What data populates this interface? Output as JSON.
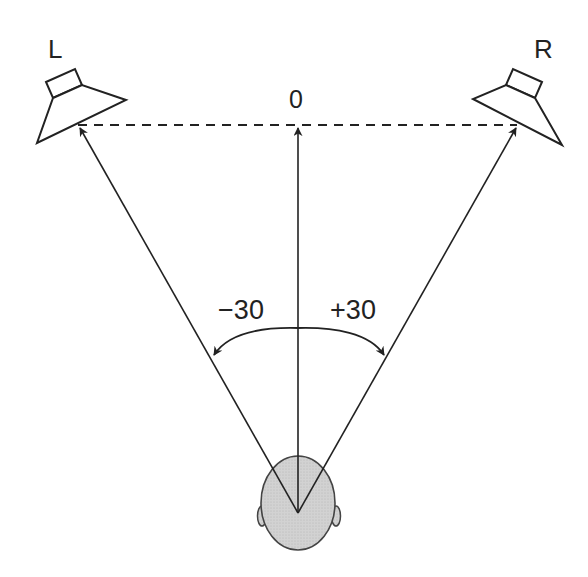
{
  "diagram": {
    "type": "stereo-listening-triangle",
    "speakers": {
      "left": {
        "label": "L"
      },
      "right": {
        "label": "R"
      }
    },
    "center_label": "0",
    "angles": {
      "left": "−30",
      "right": "+30"
    },
    "listener": "head-top-view"
  },
  "colors": {
    "stroke": "#222222",
    "head_fill": "#cfcfcf",
    "background": "#ffffff"
  }
}
